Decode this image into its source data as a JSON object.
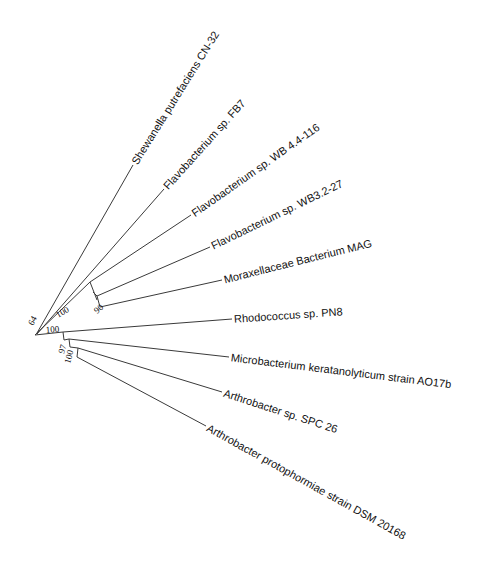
{
  "diagram": {
    "type": "phylogenetic-tree",
    "layout": "radial-slanted",
    "line_color": "#3a3a3a",
    "text_color": "#111111",
    "root": {
      "x": 35,
      "y": 335,
      "support": "64",
      "support_pos": {
        "x": 33,
        "y": 326,
        "rot": -62
      }
    },
    "internal_nodes": [
      {
        "id": "n_flavo",
        "from": {
          "x": 35,
          "y": 335
        },
        "elbow": {
          "x": 90,
          "y": 282
        },
        "elbow_end": {
          "x": 97,
          "y": 300
        },
        "support": "100",
        "support_pos": {
          "x": 58,
          "y": 318,
          "rot": -30
        }
      },
      {
        "id": "n_morax",
        "from": {
          "x": 93,
          "y": 292
        },
        "elbow": {
          "x": 97,
          "y": 296
        },
        "elbow_end": {
          "x": 100,
          "y": 307
        },
        "support": "90",
        "support_pos": {
          "x": 97,
          "y": 314,
          "rot": -40
        }
      },
      {
        "id": "n_actino",
        "from": {
          "x": 35,
          "y": 335
        },
        "elbow": {
          "x": 63,
          "y": 332
        },
        "elbow_end": {
          "x": 64,
          "y": 340
        },
        "support": "100",
        "support_pos": {
          "x": 46,
          "y": 333,
          "rot": -5
        }
      },
      {
        "id": "n_micro",
        "from": {
          "x": 64,
          "y": 340
        },
        "elbow": {
          "x": 69,
          "y": 339
        },
        "elbow_end": {
          "x": 70,
          "y": 347
        },
        "support": "97",
        "support_pos": {
          "x": 64,
          "y": 354,
          "rot": -75
        }
      },
      {
        "id": "n_arthro",
        "from": {
          "x": 70,
          "y": 347
        },
        "elbow": {
          "x": 78,
          "y": 348
        },
        "elbow_end": {
          "x": 77,
          "y": 357
        },
        "support": "100",
        "support_pos": {
          "x": 70,
          "y": 364,
          "rot": -75
        }
      }
    ],
    "leaves": [
      {
        "name": "Shewanella putrefaciens CN-32",
        "from": {
          "x": 37,
          "y": 333
        },
        "to": {
          "x": 133,
          "y": 165
        },
        "rot": -58
      },
      {
        "name": "Flavobacterium sp. FB7",
        "from": {
          "x": 37,
          "y": 334
        },
        "to": {
          "x": 164,
          "y": 189
        },
        "rot": -48
      },
      {
        "name": "Flavobacterium sp. WB 4.4-116",
        "from": {
          "x": 90,
          "y": 282
        },
        "to": {
          "x": 191,
          "y": 215
        },
        "rot": -35
      },
      {
        "name": "Flavobacterium sp. WB3.2-27",
        "from": {
          "x": 97,
          "y": 296
        },
        "to": {
          "x": 210,
          "y": 247
        },
        "rot": -26
      },
      {
        "name": "Moraxellaceae Bacterium MAG",
        "from": {
          "x": 100,
          "y": 307
        },
        "to": {
          "x": 222,
          "y": 280
        },
        "rot": -14
      },
      {
        "name": "Rhodococcus sp. PN8",
        "from": {
          "x": 63,
          "y": 332
        },
        "to": {
          "x": 232,
          "y": 319
        },
        "rot": -4
      },
      {
        "name": "Microbacterium keratanolyticum strain AO17b",
        "from": {
          "x": 69,
          "y": 339
        },
        "to": {
          "x": 229,
          "y": 357
        },
        "rot": 7
      },
      {
        "name": "Arthrobacter sp. SPC 26",
        "from": {
          "x": 78,
          "y": 348
        },
        "to": {
          "x": 222,
          "y": 392
        },
        "rot": 18
      },
      {
        "name": "Arthrobacter protophormiae strain DSM 20168",
        "from": {
          "x": 77,
          "y": 357
        },
        "to": {
          "x": 206,
          "y": 426
        },
        "rot": 29
      }
    ]
  }
}
